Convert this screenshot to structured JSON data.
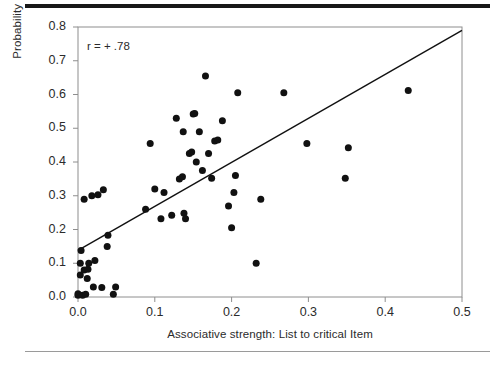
{
  "figure": {
    "annotation": "r = + .78",
    "rules": {
      "top_color": "#171717",
      "bottom_color": "#9a9a9a"
    }
  },
  "chart_data": {
    "type": "scatter",
    "title": "",
    "subtitle": "",
    "xlabel": "Associative strength: List to critical Item",
    "ylabel": "Probability of false recall",
    "xlim": [
      0.0,
      0.5
    ],
    "ylim": [
      0.0,
      0.8
    ],
    "xticks": [
      0.0,
      0.1,
      0.2,
      0.3,
      0.4,
      0.5
    ],
    "yticks": [
      0.0,
      0.1,
      0.2,
      0.3,
      0.4,
      0.5,
      0.6,
      0.7,
      0.8
    ],
    "xtick_labels": [
      "0.0",
      "0.1",
      "0.2",
      "0.3",
      "0.4",
      "0.5"
    ],
    "ytick_labels": [
      "0.0",
      "0.1",
      "0.2",
      "0.3",
      "0.4",
      "0.5",
      "0.6",
      "0.7",
      "0.8"
    ],
    "grid": false,
    "legend": null,
    "annotations": [
      {
        "text": "r = + .78",
        "x": 0.012,
        "y": 0.745
      }
    ],
    "marker": {
      "shape": "circle",
      "color": "#111111",
      "size_px": 7
    },
    "series": [
      {
        "name": "Study lists",
        "points": [
          [
            0.0,
            0.005
          ],
          [
            0.0,
            0.01
          ],
          [
            0.003,
            0.065
          ],
          [
            0.003,
            0.1
          ],
          [
            0.004,
            0.138
          ],
          [
            0.006,
            0.005
          ],
          [
            0.008,
            0.08
          ],
          [
            0.008,
            0.29
          ],
          [
            0.01,
            0.008
          ],
          [
            0.012,
            0.055
          ],
          [
            0.013,
            0.082
          ],
          [
            0.014,
            0.1
          ],
          [
            0.018,
            0.3
          ],
          [
            0.02,
            0.03
          ],
          [
            0.022,
            0.108
          ],
          [
            0.026,
            0.303
          ],
          [
            0.031,
            0.028
          ],
          [
            0.033,
            0.318
          ],
          [
            0.038,
            0.15
          ],
          [
            0.039,
            0.183
          ],
          [
            0.046,
            0.008
          ],
          [
            0.049,
            0.03
          ],
          [
            0.088,
            0.26
          ],
          [
            0.094,
            0.455
          ],
          [
            0.1,
            0.32
          ],
          [
            0.108,
            0.232
          ],
          [
            0.112,
            0.31
          ],
          [
            0.122,
            0.242
          ],
          [
            0.128,
            0.53
          ],
          [
            0.132,
            0.35
          ],
          [
            0.136,
            0.356
          ],
          [
            0.137,
            0.49
          ],
          [
            0.138,
            0.248
          ],
          [
            0.14,
            0.232
          ],
          [
            0.145,
            0.425
          ],
          [
            0.148,
            0.43
          ],
          [
            0.15,
            0.542
          ],
          [
            0.152,
            0.544
          ],
          [
            0.154,
            0.4
          ],
          [
            0.158,
            0.49
          ],
          [
            0.162,
            0.375
          ],
          [
            0.166,
            0.655
          ],
          [
            0.17,
            0.425
          ],
          [
            0.174,
            0.352
          ],
          [
            0.178,
            0.462
          ],
          [
            0.182,
            0.465
          ],
          [
            0.188,
            0.522
          ],
          [
            0.196,
            0.27
          ],
          [
            0.2,
            0.205
          ],
          [
            0.203,
            0.31
          ],
          [
            0.205,
            0.36
          ],
          [
            0.208,
            0.605
          ],
          [
            0.232,
            0.1
          ],
          [
            0.238,
            0.29
          ],
          [
            0.268,
            0.605
          ],
          [
            0.298,
            0.455
          ],
          [
            0.348,
            0.352
          ],
          [
            0.352,
            0.442
          ],
          [
            0.43,
            0.612
          ]
        ]
      }
    ],
    "trendline": {
      "type": "linear-fit",
      "x_start": 0.0,
      "y_start": 0.138,
      "x_end": 0.5,
      "y_end": 0.79,
      "color": "#111111"
    }
  }
}
